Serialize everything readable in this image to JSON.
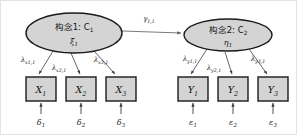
{
  "diagram": {
    "type": "structural-equation-model-path-diagram",
    "background_color": "#ffffff",
    "frame_color": "#e3e3e3",
    "shape_fill_color": "#d4d4d4",
    "shape_stroke_color": "#1a1a1a",
    "arrow_color": "#4a4a4a"
  },
  "latent_variables": [
    {
      "id": "construct-1",
      "label": "构念1: C",
      "label_subscript": "1",
      "greek_symbol": "ξ",
      "greek_subscript": "1",
      "role": "exogenous",
      "cx": 73,
      "cy": 32,
      "rx": 48,
      "ry": 20
    },
    {
      "id": "construct-2",
      "label": "构念2: C",
      "label_subscript": "2",
      "greek_symbol": "η",
      "greek_subscript": "1",
      "role": "endogenous",
      "cx": 227,
      "cy": 34,
      "rx": 44,
      "ry": 16
    }
  ],
  "structural_path": {
    "id": "gamma-path",
    "symbol": "γ",
    "subscript": "1,1",
    "from": "construct-1",
    "to": "construct-2",
    "label_x": 148,
    "label_y": 18
  },
  "indicators_x": [
    {
      "id": "x1",
      "symbol": "X",
      "subscript": "1",
      "x": 25,
      "y": 76,
      "w": 30,
      "h": 24
    },
    {
      "id": "x2",
      "symbol": "X",
      "subscript": "2",
      "x": 65,
      "y": 76,
      "w": 30,
      "h": 24
    },
    {
      "id": "x3",
      "symbol": "X",
      "subscript": "3",
      "x": 105,
      "y": 76,
      "w": 30,
      "h": 24
    }
  ],
  "indicators_y": [
    {
      "id": "y1",
      "symbol": "Y",
      "subscript": "1",
      "x": 177,
      "y": 76,
      "w": 30,
      "h": 24
    },
    {
      "id": "y2",
      "symbol": "Y",
      "subscript": "2",
      "x": 217,
      "y": 76,
      "w": 30,
      "h": 24
    },
    {
      "id": "y3",
      "symbol": "Y",
      "subscript": "3",
      "x": 257,
      "y": 76,
      "w": 30,
      "h": 24
    }
  ],
  "loadings_x": [
    {
      "id": "lambda-x1",
      "symbol": "λ",
      "subscript": "x1,1",
      "label_x": 27,
      "label_y": 59
    },
    {
      "id": "lambda-x2",
      "symbol": "λ",
      "subscript": "x2,1",
      "label_x": 57,
      "label_y": 66
    },
    {
      "id": "lambda-x3",
      "symbol": "λ",
      "subscript": "x3,1",
      "label_x": 100,
      "label_y": 59
    }
  ],
  "loadings_y": [
    {
      "id": "lambda-y1",
      "symbol": "λ",
      "subscript": "y1,1",
      "label_x": 188,
      "label_y": 58
    },
    {
      "id": "lambda-y2",
      "symbol": "λ",
      "subscript": "y2,1",
      "label_x": 212,
      "label_y": 66
    },
    {
      "id": "lambda-y3",
      "symbol": "λ",
      "subscript": "y3,1",
      "label_x": 258,
      "label_y": 58
    }
  ],
  "errors_x": [
    {
      "id": "delta1",
      "symbol": "δ",
      "subscript": "1",
      "label_x": 40,
      "label_y": 122
    },
    {
      "id": "delta2",
      "symbol": "δ",
      "subscript": "2",
      "label_x": 80,
      "label_y": 122
    },
    {
      "id": "delta3",
      "symbol": "δ",
      "subscript": "3",
      "label_x": 120,
      "label_y": 122
    }
  ],
  "errors_y": [
    {
      "id": "epsilon1",
      "symbol": "ε",
      "subscript": "1",
      "label_x": 192,
      "label_y": 122
    },
    {
      "id": "epsilon2",
      "symbol": "ε",
      "subscript": "2",
      "label_x": 232,
      "label_y": 122
    },
    {
      "id": "epsilon3",
      "symbol": "ε",
      "subscript": "3",
      "label_x": 272,
      "label_y": 122
    }
  ]
}
